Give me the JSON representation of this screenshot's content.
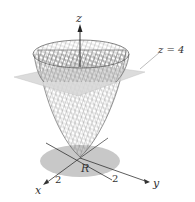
{
  "figure": {
    "labels": {
      "z_axis": "z",
      "plane": "z = 4",
      "region": "R",
      "x_axis": "x",
      "y_axis": "y",
      "x_tick": "2",
      "y_tick": "2"
    },
    "colors": {
      "surface_mesh": "#555555",
      "plane": "#d6d6d6",
      "region": "#c8c8c8",
      "axes": "#333333"
    }
  }
}
